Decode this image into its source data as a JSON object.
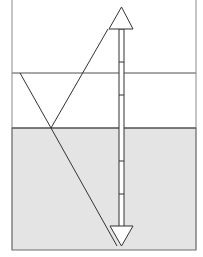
{
  "diagram": {
    "title": "",
    "colors": {
      "background": "#ffffff",
      "medium": "#e4e4e4",
      "frame": "#6a6a6a",
      "interface": "#8a8a8a",
      "ray": "#333333",
      "arrow_fill": "#ffffff",
      "arrow_stroke": "#333333"
    },
    "frame": {
      "left": 12,
      "right": 196,
      "bottom": 250
    },
    "interface_line_y": 73,
    "medium_top_y": 128,
    "ray": {
      "incoming_start": [
        20,
        73
      ],
      "reflection_point": [
        51,
        128
      ],
      "reflected_end": [
        108,
        29
      ],
      "refracted_end": [
        117,
        246
      ]
    },
    "double_arrow": {
      "x": 121,
      "top_tip_y": 6,
      "bottom_tip_y": 246,
      "tick_marks_y": [
        62,
        95,
        161,
        194
      ]
    }
  }
}
